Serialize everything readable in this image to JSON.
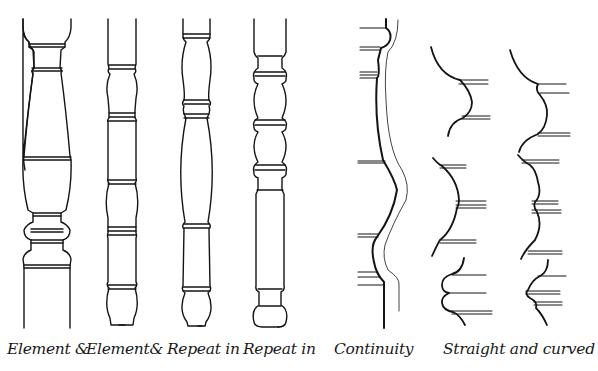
{
  "figure": {
    "ink_color": "#141414",
    "background": "#ffffff",
    "labels": [
      {
        "id": "spindle-1",
        "text": "Element &"
      },
      {
        "id": "spindle-2",
        "text": "Element&"
      },
      {
        "id": "spindle-3",
        "text": "Repeat in"
      },
      {
        "id": "spindle-4",
        "text": "Repeat in"
      },
      {
        "id": "profile-continuity",
        "text": "Continuity"
      },
      {
        "id": "profiles-straight-curved",
        "text": "Straight and curved"
      }
    ]
  }
}
